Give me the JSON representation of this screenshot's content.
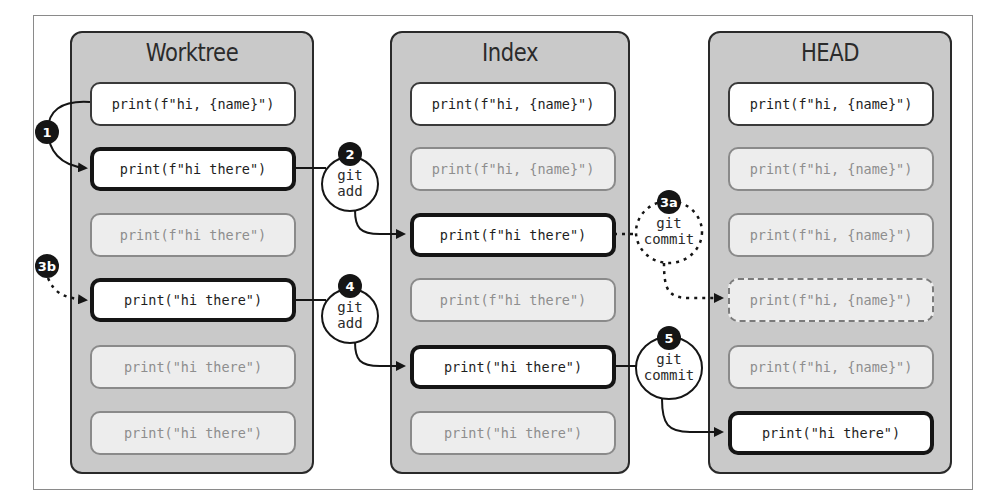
{
  "diagram": {
    "panels": [
      {
        "id": "worktree",
        "title": "Worktree",
        "cards": [
          {
            "text": "print(f\"hi, {name}\")",
            "style": "normal"
          },
          {
            "text": "print(f\"hi there\")",
            "style": "bold"
          },
          {
            "text": "print(f\"hi there\")",
            "style": "faded"
          },
          {
            "text": "print(\"hi there\")",
            "style": "bold"
          },
          {
            "text": "print(\"hi there\")",
            "style": "faded"
          },
          {
            "text": "print(\"hi there\")",
            "style": "faded"
          }
        ]
      },
      {
        "id": "index",
        "title": "Index",
        "cards": [
          {
            "text": "print(f\"hi, {name}\")",
            "style": "normal"
          },
          {
            "text": "print(f\"hi, {name}\")",
            "style": "faded"
          },
          {
            "text": "print(f\"hi there\")",
            "style": "bold"
          },
          {
            "text": "print(f\"hi there\")",
            "style": "faded"
          },
          {
            "text": "print(\"hi there\")",
            "style": "bold"
          },
          {
            "text": "print(\"hi there\")",
            "style": "faded"
          }
        ]
      },
      {
        "id": "head",
        "title": "HEAD",
        "cards": [
          {
            "text": "print(f\"hi, {name}\")",
            "style": "normal"
          },
          {
            "text": "print(f\"hi, {name}\")",
            "style": "faded"
          },
          {
            "text": "print(f\"hi, {name}\")",
            "style": "faded"
          },
          {
            "text": "print(f\"hi, {name}\")",
            "style": "dashed"
          },
          {
            "text": "print(f\"hi, {name}\")",
            "style": "faded"
          },
          {
            "text": "print(\"hi there\")",
            "style": "bold"
          }
        ]
      }
    ],
    "steps": [
      {
        "badge": "1",
        "label": ""
      },
      {
        "badge": "2",
        "label_line1": "git",
        "label_line2": "add"
      },
      {
        "badge": "3a",
        "label_line1": "git",
        "label_line2": "commit"
      },
      {
        "badge": "3b",
        "label": ""
      },
      {
        "badge": "4",
        "label_line1": "git",
        "label_line2": "add"
      },
      {
        "badge": "5",
        "label_line1": "git",
        "label_line2": "commit"
      }
    ],
    "colors": {
      "panel_bg": "#c9c9c9",
      "card_bg": "#ffffff",
      "faded_card_bg": "#ededed",
      "badge_bg": "#151515"
    }
  }
}
